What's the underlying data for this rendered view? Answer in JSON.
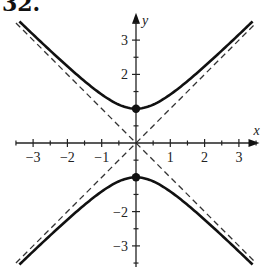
{
  "problem_number": "32.",
  "chart_data": {
    "type": "line",
    "title": "",
    "equation": "y^2 - x^2 = 1",
    "xlabel": "x",
    "ylabel": "y",
    "xlim": [
      -3.5,
      3.6
    ],
    "ylim": [
      -3.7,
      3.8
    ],
    "grid": false,
    "legend": null,
    "x_ticks": [
      -3,
      -2,
      -1,
      1,
      2,
      3
    ],
    "x_tick_labels": [
      "−3",
      "−2",
      "−1",
      "1",
      "2",
      "3"
    ],
    "y_ticks": [
      3,
      2,
      -2,
      -3
    ],
    "y_tick_labels": [
      "3",
      "2",
      "−2",
      "−3"
    ],
    "series": [
      {
        "name": "upper branch",
        "style": "solid",
        "function": "y = sqrt(1 + x^2)",
        "x_range": [
          -3.4,
          3.4
        ]
      },
      {
        "name": "lower branch",
        "style": "solid",
        "function": "y = -sqrt(1 + x^2)",
        "x_range": [
          -3.4,
          3.4
        ]
      },
      {
        "name": "asymptote y = x",
        "style": "dashed",
        "function": "y = x",
        "x_range": [
          -3.5,
          3.5
        ]
      },
      {
        "name": "asymptote y = -x",
        "style": "dashed",
        "function": "y = -x",
        "x_range": [
          -3.5,
          3.5
        ]
      }
    ],
    "points": [
      {
        "x": 0,
        "y": 1,
        "label": "vertex"
      },
      {
        "x": 0,
        "y": -1,
        "label": "vertex"
      }
    ]
  }
}
